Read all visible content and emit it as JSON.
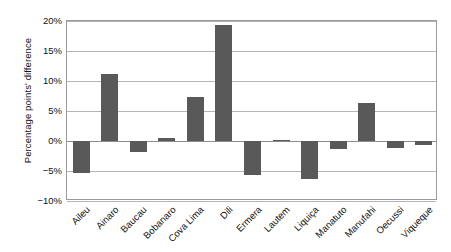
{
  "chart_data": {
    "type": "bar",
    "title": "",
    "subtitle": "",
    "xlabel": "",
    "ylabel": "Percentage points' difference",
    "ylim": [
      -10,
      20
    ],
    "ytick_values": [
      20,
      15,
      10,
      5,
      0,
      -5,
      -10
    ],
    "ytick_labels": [
      "20%",
      "15%",
      "10%",
      "5%",
      "0%",
      "−5%",
      "−10%"
    ],
    "grid": true,
    "legend": false,
    "legend_position": "none",
    "bar_color": "#595959",
    "categories": [
      "Aileu",
      "Ainaro",
      "Baucau",
      "Bobanaro",
      "Cova Lima",
      "Dili",
      "Ermera",
      "Lautem",
      "Liquiça",
      "Manatuto",
      "Manufahi",
      "Oecussi",
      "Viqueque"
    ],
    "values": [
      -5.4,
      11.2,
      -1.8,
      0.5,
      7.3,
      19.4,
      -5.6,
      0.2,
      -6.4,
      -1.4,
      6.4,
      -1.1,
      -0.6
    ]
  },
  "axes": {
    "frame_color": "#9a9a9a",
    "gridline_color": "#b5b5b5",
    "zero_line_color": "#8c8c8c"
  }
}
